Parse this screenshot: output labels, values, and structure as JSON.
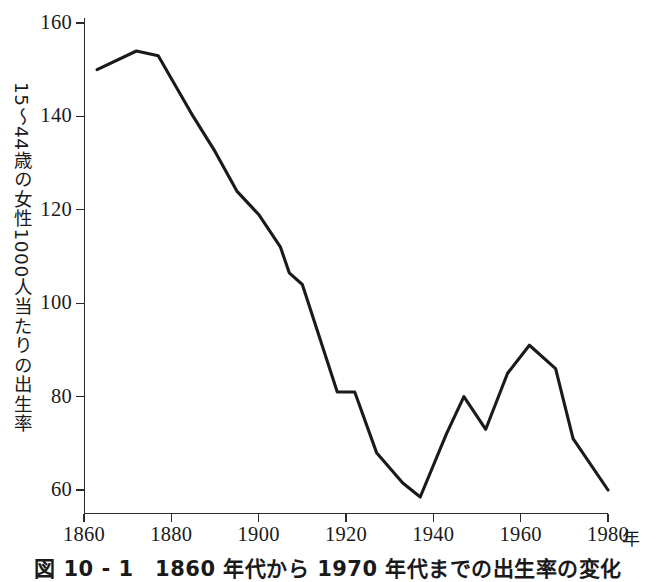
{
  "caption": "図 10 - 1　1860 年代から 1970 年代までの出生率の変化",
  "axes": {
    "y_title": "15〜44歳の女性1000人当たりの出生率",
    "x_unit": "年",
    "y_ticks": [
      "160",
      "140",
      "120",
      "100",
      "80",
      "60"
    ],
    "x_ticks": [
      "1860",
      "1880",
      "1900",
      "1920",
      "1940",
      "1960",
      "1980"
    ]
  },
  "chart_data": {
    "type": "line",
    "title": "図 10 - 1　1860 年代から 1970 年代までの出生率の変化",
    "xlabel": "年",
    "ylabel": "15〜44歳の女性1000人当たりの出生率",
    "xlim": [
      1860,
      1980
    ],
    "ylim": [
      52,
      163
    ],
    "xticks": [
      1860,
      1880,
      1900,
      1920,
      1940,
      1960,
      1980
    ],
    "yticks": [
      60,
      80,
      100,
      120,
      140,
      160
    ],
    "grid": false,
    "legend": "none",
    "line_color": "#1a1a1a",
    "series": [
      {
        "name": "15〜44歳の女性1000人当たりの出生率",
        "points": [
          {
            "x": 1863,
            "y": 150.0
          },
          {
            "x": 1872,
            "y": 154.0
          },
          {
            "x": 1877,
            "y": 153.0
          },
          {
            "x": 1885,
            "y": 140.0
          },
          {
            "x": 1890,
            "y": 132.5
          },
          {
            "x": 1895,
            "y": 124.0
          },
          {
            "x": 1900,
            "y": 119.0
          },
          {
            "x": 1905,
            "y": 112.0
          },
          {
            "x": 1907,
            "y": 106.5
          },
          {
            "x": 1910,
            "y": 104.0
          },
          {
            "x": 1918,
            "y": 81.0
          },
          {
            "x": 1922,
            "y": 81.0
          },
          {
            "x": 1927,
            "y": 68.0
          },
          {
            "x": 1933,
            "y": 61.5
          },
          {
            "x": 1937,
            "y": 58.5
          },
          {
            "x": 1943,
            "y": 72.0
          },
          {
            "x": 1947,
            "y": 80.0
          },
          {
            "x": 1952,
            "y": 73.0
          },
          {
            "x": 1957,
            "y": 85.0
          },
          {
            "x": 1962,
            "y": 91.0
          },
          {
            "x": 1968,
            "y": 86.0
          },
          {
            "x": 1972,
            "y": 71.0
          },
          {
            "x": 1980,
            "y": 60.0
          }
        ]
      }
    ]
  }
}
